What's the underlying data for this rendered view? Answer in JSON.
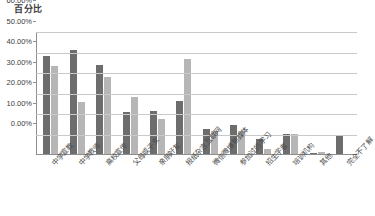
{
  "chart_data": {
    "type": "bar",
    "title": "",
    "ylabel": "百分比",
    "xlabel": "",
    "ylim": [
      0,
      60
    ],
    "yticks": [
      "0.00%",
      "10.00%",
      "20.00%",
      "30.00%",
      "40.00%",
      "50.00%",
      "60.00%"
    ],
    "ytick_values": [
      0,
      10,
      20,
      30,
      40,
      50,
      60
    ],
    "grid": true,
    "legend": "none",
    "categories": [
      "中学宣教",
      "中学教师",
      "高校宣传",
      "父母或子女",
      "亲朋好友",
      "报纸杂志互联网",
      "微信微博新媒体",
      "参加过的学习",
      "招生字者",
      "培训机构",
      "其他",
      "完全不了解"
    ],
    "series": [
      {
        "name": "系列1",
        "color": "#6d6d6d",
        "values": [
          48.0,
          50.5,
          43.5,
          20.5,
          21.0,
          26.0,
          12.0,
          14.0,
          7.5,
          10.0,
          0.5,
          9.5
        ]
      },
      {
        "name": "系列2",
        "color": "#b6b6b6",
        "values": [
          43.0,
          25.5,
          37.5,
          28.0,
          17.0,
          46.5,
          11.0,
          11.0,
          2.5,
          10.0,
          1.0,
          0.0
        ]
      }
    ]
  },
  "colors": {
    "gridline": "#c9c9c9",
    "axis": "#8e8e8e",
    "text": "#3d3d3d",
    "series_dark": "#6d6d6d",
    "series_light": "#b6b6b6",
    "background": "#ffffff"
  }
}
